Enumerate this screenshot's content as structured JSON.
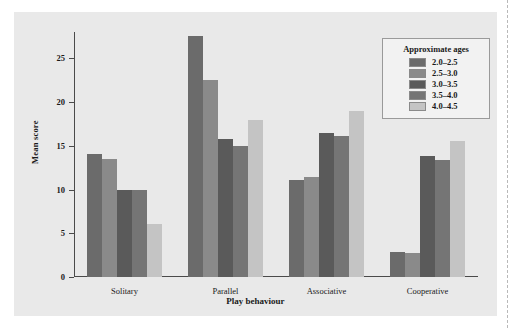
{
  "chart_data": {
    "type": "bar",
    "title": "",
    "xlabel": "Play behaviour",
    "ylabel": "Mean score",
    "categories": [
      "Solitary",
      "Parallel",
      "Associative",
      "Cooperative"
    ],
    "ylim": [
      0,
      28
    ],
    "yticks": [
      0,
      5,
      10,
      15,
      20,
      25
    ],
    "ytick_labels": [
      "0",
      "5",
      "10",
      "15",
      "20",
      "25"
    ],
    "grid": false,
    "legend_position": "top-right",
    "legend_title": "Approximate ages",
    "series": [
      {
        "name": "2.0–2.5",
        "color": "#6b6b6b",
        "values": [
          14.1,
          27.5,
          11.1,
          2.9
        ]
      },
      {
        "name": "2.5–3.0",
        "color": "#8a8a8a",
        "values": [
          13.5,
          22.5,
          11.4,
          2.7
        ]
      },
      {
        "name": "3.0–3.5",
        "color": "#5a5a5a",
        "values": [
          9.9,
          15.8,
          16.5,
          13.8
        ]
      },
      {
        "name": "3.5–4.0",
        "color": "#757575",
        "values": [
          9.9,
          15.0,
          16.1,
          13.4
        ]
      },
      {
        "name": "4.0–4.5",
        "color": "#c4c4c4",
        "values": [
          6.1,
          17.9,
          19.0,
          15.6
        ]
      }
    ]
  },
  "colors": {
    "panel_background": "#e9e9e9",
    "page_background": "#ffffff",
    "axis": "#4a4a4a",
    "legend_background": "#f2f2f2",
    "legend_border": "#9a9a9a",
    "text": "#1a1a1a"
  }
}
